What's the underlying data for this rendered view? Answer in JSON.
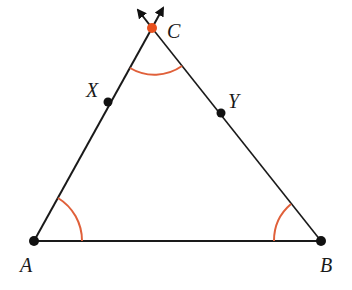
{
  "diagram": {
    "type": "triangle",
    "colors": {
      "line": "#1a1a1a",
      "accent": "#e0603a",
      "point": "#111111",
      "apex": "#e8501e"
    },
    "points": {
      "A": {
        "label": "A",
        "x": 34,
        "y": 241
      },
      "B": {
        "label": "B",
        "x": 321,
        "y": 241
      },
      "C": {
        "label": "C",
        "x": 152,
        "y": 28
      },
      "X": {
        "label": "X",
        "x": 108,
        "y": 102
      },
      "Y": {
        "label": "Y",
        "x": 221,
        "y": 113
      }
    },
    "angle_marks": [
      "A",
      "B",
      "C"
    ],
    "arrows": "Sides AC and BC extended beyond C with arrowheads"
  }
}
